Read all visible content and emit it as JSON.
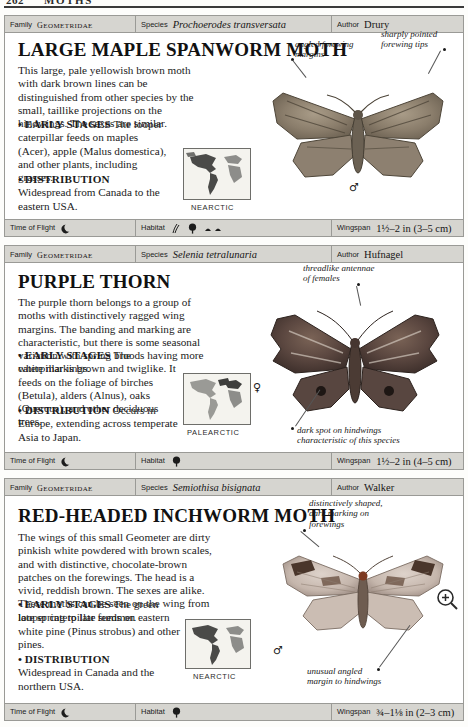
{
  "running_head": {
    "page_number": "262",
    "section": "MOTHS"
  },
  "column_labels": {
    "family": "Family",
    "species": "Species",
    "author": "Author",
    "time_of_flight": "Time of Flight",
    "habitat": "Habitat",
    "wingspan": "Wingspan"
  },
  "entries": [
    {
      "family": "GEOMETRIDAE",
      "species": "Prochoerodes transversata",
      "author": "Drury",
      "common_name": "LARGE MAPLE SPANWORM MOTH",
      "description": "This large, pale yellowish brown moth with dark brown lines can be distinguished from other species by the small, taillike projections on the hindwings. The sexes are similar.",
      "early_stages_label": "EARLY STAGES",
      "early_stages": "The looper caterpillar feeds on maples (Acer), apple (Malus domestica), and other plants, including grasses.",
      "distribution_label": "DISTRIBUTION",
      "distribution": "Widespread from Canada to the eastern USA.",
      "map_caption": "NEARCTIC",
      "sex_symbol": "male",
      "annotations": [
        "angled forewing\nmargins",
        "sharply pointed\nforewing tips"
      ],
      "time_of_flight_icons": [
        "night-moon-icon"
      ],
      "habitat_icons": [
        "grassland-icon",
        "deciduous-tree-icon",
        "scrub-icon"
      ],
      "wingspan": "1½–2 in (3–5 cm)"
    },
    {
      "family": "GEOMETRIDAE",
      "species": "Selenia tetralunaria",
      "author": "Hufnagel",
      "common_name": "PURPLE THORN",
      "description": "The purple thorn belongs to a group of moths with distinctively ragged wing margins. The banding and marking are characteristic, but there is some seasonal variation with spring broods having more white markings.",
      "early_stages_label": "EARLY STAGES",
      "early_stages": "The caterpillar is brown and twiglike. It feeds on the foliage of birches (Betula), alders (Alnus), oaks (Quercus), and other deciduous trees.",
      "distribution_label": "DISTRIBUTION",
      "distribution": "Occurs in Europe, extending across temperate Asia to Japan.",
      "map_caption": "PALEARCTIC",
      "sex_symbol": "female",
      "annotations": [
        "threadlike antennae\nof females",
        "dark spot on hindwings\ncharacteristic of this species"
      ],
      "time_of_flight_icons": [
        "night-moon-icon"
      ],
      "habitat_icons": [
        "deciduous-tree-icon"
      ],
      "wingspan": "1½–2 in (4–5 cm)"
    },
    {
      "family": "GEOMETRIDAE",
      "species": "Semiothisa bisignata",
      "author": "Walker",
      "common_name": "RED-HEADED INCHWORM MOTH",
      "description": "The wings of this small Geometer are dirty pinkish white powdered with brown scales, and with distinctive, chocolate-brown patches on the forewings. The head is a vivid, reddish brown. The sexes are alike. These moths can be seen on the wing from late spring to late summer.",
      "early_stages_label": "EARLY STAGES",
      "early_stages": "The green looper caterpillar feeds on eastern white pine (Pinus strobus) and other pines.",
      "distribution_label": "DISTRIBUTION",
      "distribution": "Widespread in Canada and the northern USA.",
      "map_caption": "NEARCTIC",
      "sex_symbol": "male",
      "annotations": [
        "distinctively shaped,\ndark marking on\nforewings",
        "unusual angled\nmargin to hindwings"
      ],
      "time_of_flight_icons": [
        "night-moon-icon"
      ],
      "habitat_icons": [
        "deciduous-tree-icon"
      ],
      "wingspan": "¾–1⅛ in (2–3 cm)"
    }
  ],
  "cursor": {
    "type": "magnifier-zoom-cursor"
  },
  "colors": {
    "bar_background": "#d6d5d0",
    "border": "#9a9a96",
    "text": "#1b1b1b",
    "page_background": "#fdfdfb"
  }
}
